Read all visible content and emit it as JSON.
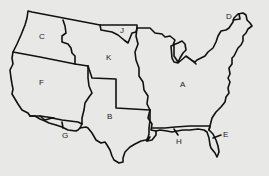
{
  "map": {
    "title": "United States territorial regions (lettered)",
    "background_color": "#e8e8e6",
    "line_color": "#111111",
    "regions": [
      {
        "label": "A",
        "x": 180,
        "y": 84
      },
      {
        "label": "B",
        "x": 107,
        "y": 116
      },
      {
        "label": "C",
        "x": 39,
        "y": 35
      },
      {
        "label": "D",
        "x": 227,
        "y": 15
      },
      {
        "label": "E",
        "x": 223,
        "y": 133
      },
      {
        "label": "F",
        "x": 39,
        "y": 81
      },
      {
        "label": "G",
        "x": 63,
        "y": 134
      },
      {
        "label": "H",
        "x": 176,
        "y": 140
      },
      {
        "label": "J",
        "x": 121,
        "y": 29
      },
      {
        "label": "K",
        "x": 106,
        "y": 56
      }
    ]
  }
}
